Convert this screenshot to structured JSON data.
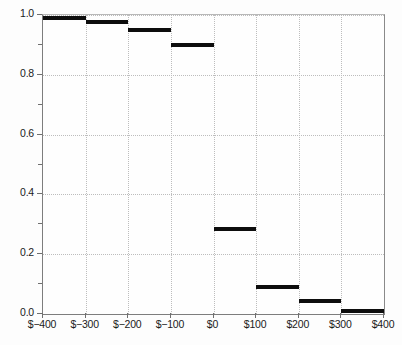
{
  "chart_data": {
    "type": "bar",
    "title": "",
    "subtitle": "",
    "xlabel": "",
    "ylabel": "",
    "grid": true,
    "legend": false,
    "xlim": [
      -400,
      400
    ],
    "ylim": [
      0.0,
      1.0
    ],
    "x_tick_labels": [
      "$−400",
      "$−300",
      "$−200",
      "$−100",
      "$0",
      "$100",
      "$200",
      "$300",
      "$400"
    ],
    "x_tick_values": [
      -400,
      -300,
      -200,
      -100,
      0,
      100,
      200,
      300,
      400
    ],
    "y_tick_labels": [
      "0.0",
      "0.2",
      "0.4",
      "0.6",
      "0.8",
      "1.0"
    ],
    "y_tick_values": [
      0.0,
      0.2,
      0.4,
      0.6,
      0.8,
      1.0
    ],
    "y_minor_tick_values": [
      0.1,
      0.3,
      0.5,
      0.7,
      0.9
    ],
    "categories": [
      "$−400 to $−300",
      "$−300 to $−200",
      "$−200 to $−100",
      "$−100 to $0",
      "$0 to $100",
      "$100 to $200",
      "$200 to $300",
      "$300 to $400"
    ],
    "bin_edges": [
      -400,
      -300,
      -200,
      -100,
      0,
      100,
      200,
      300,
      400
    ],
    "values": [
      0.99,
      0.975,
      0.95,
      0.9,
      0.285,
      0.09,
      0.045,
      0.01
    ],
    "bar_color": "#0d0d0d",
    "grid_color": "#bdbdbd",
    "axis_color": "#7d7d7d",
    "background_color": "#fefefe"
  },
  "caption": {
    "remnant_text": ""
  }
}
